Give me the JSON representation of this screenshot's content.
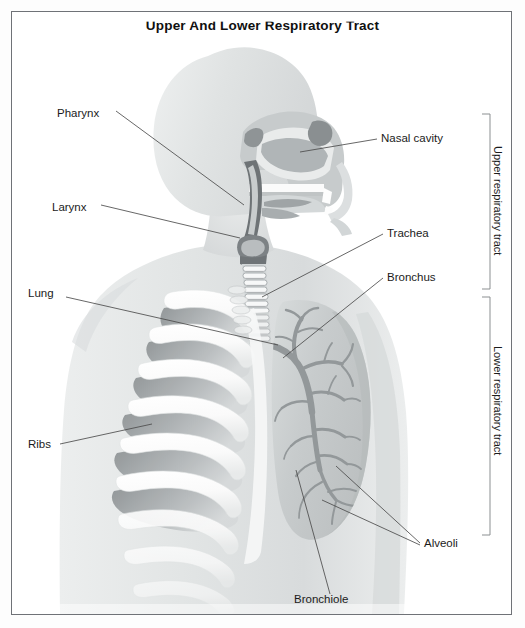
{
  "title": "Upper And Lower Respiratory Tract",
  "figure": {
    "view": "ghosted anterior torso with sagittal head section, left ribcage and right lung with bronchial tree"
  },
  "labels": [
    {
      "id": "pharynx",
      "text": "Pharynx",
      "x": 57,
      "y": 114
    },
    {
      "id": "larynx",
      "text": "Larynx",
      "x": 52,
      "y": 208
    },
    {
      "id": "lung",
      "text": "Lung",
      "x": 28,
      "y": 294
    },
    {
      "id": "ribs",
      "text": "Ribs",
      "x": 28,
      "y": 447
    },
    {
      "id": "nasal-cavity",
      "text": "Nasal cavity",
      "x": 381,
      "y": 142
    },
    {
      "id": "trachea",
      "text": "Trachea",
      "x": 387,
      "y": 237
    },
    {
      "id": "bronchus",
      "text": "Bronchus",
      "x": 387,
      "y": 281
    },
    {
      "id": "alveoli",
      "text": "Alveoli",
      "x": 424,
      "y": 546
    },
    {
      "id": "bronchiole",
      "text": "Bronchiole",
      "x": 294,
      "y": 601
    }
  ],
  "brackets": [
    {
      "id": "upper",
      "text": "Upper respiratory tract",
      "top": 114,
      "bottom": 289
    },
    {
      "id": "lower",
      "text": "Lower respiratory tract",
      "top": 297,
      "bottom": 535
    }
  ],
  "colors": {
    "frame_border": "#6f7277",
    "page_background": "#ffffff",
    "label_text": "#1b1b1b",
    "leader_line": "#4b4b4b",
    "body_silhouette": "#e4e6e6",
    "body_silhouette_dark": "#d2d5d6",
    "rib_bone": "#fbfbfb",
    "rib_shadow": "#9b9fa1",
    "lung_fill": "#c9cdcd",
    "bronchial_tree": "#9ba0a1",
    "cartilage": "#8d9193",
    "nasal_tissue": "#b5b9bb"
  }
}
